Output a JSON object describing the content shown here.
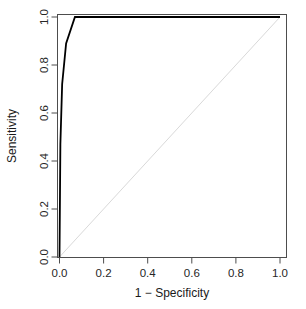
{
  "chart_data": {
    "type": "line",
    "title": "",
    "xlabel": "1 − Specificity",
    "ylabel": "Sensitivity",
    "xlim": [
      0.0,
      1.0
    ],
    "ylim": [
      0.0,
      1.0
    ],
    "grid": false,
    "legend": "none",
    "xticks": [
      "0.0",
      "0.2",
      "0.4",
      "0.6",
      "0.8",
      "1.0"
    ],
    "xtick_values": [
      0.0,
      0.2,
      0.4,
      0.6,
      0.8,
      1.0
    ],
    "yticks": [
      "0.0",
      "0.2",
      "0.4",
      "0.6",
      "0.8",
      "1.0"
    ],
    "ytick_values": [
      0.0,
      0.2,
      0.4,
      0.6,
      0.8,
      1.0
    ],
    "series": [
      {
        "name": "ROC curve",
        "color": "#000000",
        "width": 1.8,
        "x": [
          0.0,
          0.004,
          0.012,
          0.03,
          0.07,
          1.0
        ],
        "y": [
          0.0,
          0.47,
          0.72,
          0.89,
          1.0,
          1.0
        ]
      },
      {
        "name": "Chance diagonal",
        "color": "#d9d9d9",
        "width": 1.0,
        "x": [
          0.0,
          1.0
        ],
        "y": [
          0.0,
          1.0
        ]
      }
    ],
    "box_color": "#4d4d4d",
    "tick_color": "#4d4d4d",
    "background": "#ffffff"
  }
}
